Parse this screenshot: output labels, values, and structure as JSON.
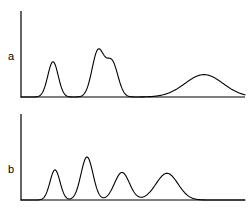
{
  "figure": {
    "background_color": "#ffffff",
    "line_color": "#000000",
    "axis_color": "#000000",
    "width": 248,
    "height": 216
  },
  "panels": [
    {
      "id": "a",
      "label": "a",
      "label_x": 11,
      "label_y": 56,
      "axis": {
        "origin_x": 21,
        "baseline_y": 97,
        "top_y": 11,
        "right_x": 245,
        "x_range": [
          21,
          245
        ],
        "y_range": [
          0,
          1
        ]
      },
      "chart_data": {
        "type": "line",
        "title": "",
        "xlabel": "",
        "ylabel": "",
        "grid": false,
        "legend": false,
        "baseline": 0,
        "peaks": [
          {
            "name": "peak-1",
            "center": 53,
            "height": 0.41,
            "width": 5.2,
            "shape": "gaussian"
          },
          {
            "name": "peak-2",
            "center": 98,
            "height": 0.53,
            "width": 6.0,
            "shape": "gaussian"
          },
          {
            "name": "peak-3",
            "center": 112,
            "height": 0.4,
            "width": 6.0,
            "shape": "gaussian"
          },
          {
            "name": "peak-4",
            "center": 204,
            "height": 0.26,
            "width": 19.0,
            "shape": "gaussian"
          }
        ]
      }
    },
    {
      "id": "b",
      "label": "b",
      "label_x": 11,
      "label_y": 169,
      "axis": {
        "origin_x": 21,
        "baseline_y": 200,
        "top_y": 114,
        "right_x": 245,
        "x_range": [
          21,
          245
        ],
        "y_range": [
          0,
          1
        ]
      },
      "chart_data": {
        "type": "line",
        "title": "",
        "xlabel": "",
        "ylabel": "",
        "grid": false,
        "legend": false,
        "baseline": 0,
        "peaks": [
          {
            "name": "peak-1",
            "center": 55,
            "height": 0.35,
            "width": 5.0,
            "shape": "gaussian"
          },
          {
            "name": "peak-2",
            "center": 87,
            "height": 0.5,
            "width": 6.0,
            "shape": "gaussian"
          },
          {
            "name": "peak-3",
            "center": 122,
            "height": 0.32,
            "width": 7.5,
            "shape": "gaussian"
          },
          {
            "name": "peak-4",
            "center": 167,
            "height": 0.31,
            "width": 11.0,
            "shape": "gaussian"
          }
        ]
      }
    }
  ]
}
